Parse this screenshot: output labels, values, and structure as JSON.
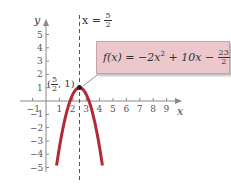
{
  "chart_data": {
    "type": "line",
    "title": "",
    "function": "f(x) = -2x^2 + 10x - 23/2",
    "xlabel": "x",
    "ylabel": "y",
    "xlim": [
      -1.5,
      9.8
    ],
    "ylim": [
      -6,
      6
    ],
    "x_ticks": [
      -1,
      1,
      2,
      3,
      4,
      5,
      6,
      7,
      8,
      9
    ],
    "y_ticks": [
      5,
      4,
      3,
      2,
      1,
      -1,
      -2,
      -3,
      -4,
      -5
    ],
    "series": [
      {
        "name": "f(x) = -2x^2 + 10x - 23/2",
        "color": "#b22a35",
        "x": [
          0.75,
          1.0,
          1.5,
          2.0,
          2.5,
          3.0,
          3.5,
          4.0,
          4.25
        ],
        "y": [
          -5.125,
          -3.5,
          -1.0,
          0.5,
          1.0,
          0.5,
          -1.0,
          -3.5,
          -5.125
        ]
      }
    ],
    "annotations": [
      {
        "text": "x = 5/2",
        "type": "axis_of_symmetry",
        "x": 2.5,
        "style": "dashed"
      },
      {
        "text": "(5/2, 1)",
        "type": "vertex",
        "x": 2.5,
        "y": 1
      }
    ],
    "grid": false,
    "legend": null
  },
  "labels": {
    "x_axis": "x",
    "y_axis": "y",
    "x_ticks": [
      "−1",
      "1",
      "2",
      "3",
      "4",
      "5",
      "6",
      "7",
      "8",
      "9"
    ],
    "y_ticks": [
      "5",
      "4",
      "3",
      "2",
      "1",
      "−1",
      "−2",
      "−3",
      "−4",
      "−5"
    ],
    "vline_prefix": "x = ",
    "vline_num": "5",
    "vline_den": "2",
    "vertex_open": "(",
    "vertex_num": "5",
    "vertex_den": "2",
    "vertex_close": ", 1)",
    "formula_main": "f(x) = −2x",
    "formula_exp": "2",
    "formula_rest": " + 10x − ",
    "formula_num": "23",
    "formula_den": "2"
  },
  "colors": {
    "curve": "#b22a35",
    "box": "#ecc7cc",
    "axis": "#888888"
  }
}
